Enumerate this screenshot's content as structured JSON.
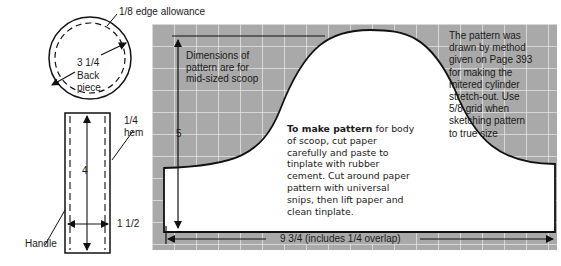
{
  "colors": {
    "grid_fill": "#a9a9a9",
    "grid_line": "#e4e4e4",
    "pattern_fill": "#ffffff",
    "outline": "#111111"
  },
  "back_piece": {
    "allowance_label": "1/8  edge allowance",
    "diameter_label": "3 1/4",
    "name_line1": "Back",
    "name_line2": "piece"
  },
  "handle": {
    "hem_line1": "1/4",
    "hem_line2": "hem",
    "length_label": "4",
    "width_label": "1 1/2",
    "name_label": "Handle"
  },
  "scoop_pattern": {
    "note_dimensions": [
      "Dimensions of",
      "pattern are for",
      "mid-sized scoop"
    ],
    "height_label": "5",
    "width_label": "9 3/4  (includes 1/4  overlap)",
    "instructions_bold": "To make pattern",
    "instructions_lines": [
      " for body",
      "of scoop, cut paper",
      "carefully and paste to",
      "tinplate with rubber",
      "cement. Cut around paper",
      "pattern with universal",
      "snips, then lift paper and",
      "clean tinplate."
    ],
    "method_note": [
      "The pattern was",
      "drawn by method",
      "given on Page 393",
      "for making the",
      "mitered cylinder",
      "stretch-out. Use",
      "5/8  grid when",
      "sketching pattern",
      "to true size"
    ]
  }
}
